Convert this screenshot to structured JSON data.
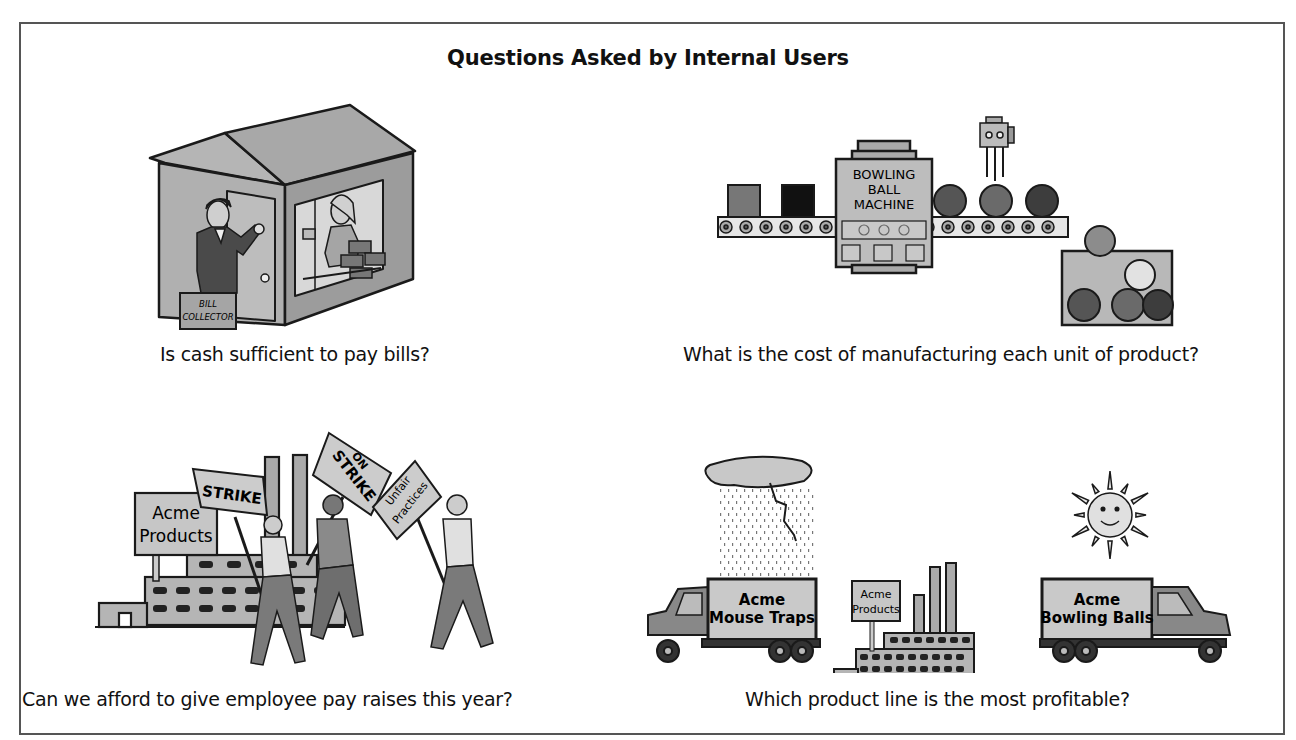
{
  "figure": {
    "title": "Questions Asked by Internal Users",
    "panels": [
      {
        "id": "cash",
        "caption": "Is cash sufficient to pay bills?",
        "illustration": "house-with-bill-collector",
        "labels": {
          "briefcase_line1": "BILL",
          "briefcase_line2": "COLLECTOR"
        }
      },
      {
        "id": "manufacturing",
        "caption": "What is the cost of manufacturing each unit of product?",
        "illustration": "bowling-ball-machine-conveyor",
        "labels": {
          "machine_line1": "BOWLING",
          "machine_line2": "BALL",
          "machine_line3": "MACHINE"
        }
      },
      {
        "id": "raises",
        "caption": "Can we afford to give employee pay raises this year?",
        "illustration": "workers-on-strike",
        "labels": {
          "factory_sign_line1": "Acme",
          "factory_sign_line2": "Products",
          "sign_strike": "STRIKE",
          "sign_on_strike_line1": "ON",
          "sign_on_strike_line2": "STRIKE",
          "sign_unfair_line1": "Unfair",
          "sign_unfair_line2": "Practices"
        }
      },
      {
        "id": "profitable",
        "caption": "Which product line is the most profitable?",
        "illustration": "product-line-trucks",
        "labels": {
          "truck1_line1": "Acme",
          "truck1_line2": "Mouse Traps",
          "factory_sign_line1": "Acme",
          "factory_sign_line2": "Products",
          "truck2_line1": "Acme",
          "truck2_line2": "Bowling Balls"
        }
      }
    ]
  },
  "colors": {
    "outline": "#1a1a1a",
    "light_gray": "#c9c9c9",
    "mid_gray": "#9a9a9a",
    "dark_gray": "#6e6e6e",
    "very_dark": "#2a2a2a",
    "frame": "#555555"
  }
}
